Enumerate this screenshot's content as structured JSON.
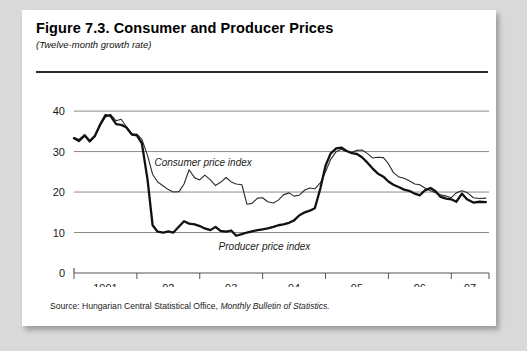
{
  "figure": {
    "title": "Figure 7.3.  Consumer and Producer Prices",
    "subtitle": "(Twelve-month growth rate)",
    "source_prefix": "Source:  Hungarian Central Statistical Office,",
    "source_italic": "Monthly Bulletin of Statistics."
  },
  "chart_data": {
    "type": "line",
    "title": "Figure 7.3.  Consumer and Producer Prices",
    "subtitle": "(Twelve-month growth rate)",
    "xlabel": "",
    "ylabel": "",
    "ylim": [
      0,
      42
    ],
    "yticks": [
      0,
      10,
      20,
      30,
      40
    ],
    "ytick_labels": [
      "0",
      "10",
      "20",
      "30",
      "40"
    ],
    "xlim": [
      1991.0,
      1997.6
    ],
    "xtick_labels": [
      "1991",
      "92",
      "93",
      "94",
      "95",
      "96",
      "97"
    ],
    "xtick_label_positions": [
      1991.5,
      1992.5,
      1993.5,
      1994.5,
      1995.5,
      1996.5,
      1997.3
    ],
    "xtick_marks": [
      1991.0,
      1992.0,
      1993.0,
      1994.0,
      1995.0,
      1996.0,
      1997.0,
      1997.6
    ],
    "grid": "horizontal",
    "legend": "inline-annotations",
    "annotations": [
      {
        "text": "Consumer price index",
        "x": 1992.28,
        "y": 26.4
      },
      {
        "text": "Producer price index",
        "x": 1993.3,
        "y": 5.6
      }
    ],
    "series": [
      {
        "name": "Consumer price index",
        "color": "#2b2b2b",
        "line_width": 1.1,
        "x": [
          1991.0,
          1991.08,
          1991.17,
          1991.25,
          1991.33,
          1991.42,
          1991.5,
          1991.58,
          1991.67,
          1991.75,
          1991.83,
          1991.92,
          1992.0,
          1992.08,
          1992.17,
          1992.25,
          1992.33,
          1992.42,
          1992.5,
          1992.58,
          1992.67,
          1992.75,
          1992.83,
          1992.92,
          1993.0,
          1993.08,
          1993.17,
          1993.25,
          1993.33,
          1993.42,
          1993.5,
          1993.58,
          1993.67,
          1993.75,
          1993.83,
          1993.92,
          1994.0,
          1994.08,
          1994.17,
          1994.25,
          1994.33,
          1994.42,
          1994.5,
          1994.58,
          1994.67,
          1994.75,
          1994.83,
          1994.92,
          1995.0,
          1995.08,
          1995.17,
          1995.25,
          1995.33,
          1995.42,
          1995.5,
          1995.58,
          1995.67,
          1995.75,
          1995.83,
          1995.92,
          1996.0,
          1996.08,
          1996.17,
          1996.25,
          1996.33,
          1996.42,
          1996.5,
          1996.58,
          1996.67,
          1996.75,
          1996.83,
          1996.92,
          1997.0,
          1997.08,
          1997.17,
          1997.25,
          1997.35,
          1997.45,
          1997.55
        ],
        "y": [
          33.5,
          33.0,
          34.2,
          32.8,
          34.0,
          36.5,
          38.5,
          39.2,
          37.6,
          38.0,
          36.2,
          34.4,
          34.3,
          33.0,
          29.0,
          24.4,
          22.5,
          21.5,
          20.6,
          20.0,
          20.1,
          22.0,
          25.5,
          23.5,
          23.0,
          24.2,
          23.0,
          21.6,
          22.4,
          23.6,
          22.5,
          22.0,
          21.8,
          17.0,
          17.2,
          18.5,
          18.6,
          17.6,
          17.3,
          18.0,
          19.3,
          19.8,
          19.0,
          19.2,
          20.5,
          21.0,
          20.8,
          22.3,
          25.0,
          28.0,
          30.0,
          30.6,
          30.0,
          29.8,
          30.3,
          30.4,
          29.5,
          28.4,
          28.6,
          28.5,
          27.0,
          24.8,
          23.7,
          23.4,
          22.8,
          22.0,
          21.8,
          21.0,
          20.3,
          19.8,
          19.3,
          19.0,
          18.6,
          19.8,
          20.3,
          19.9,
          18.6,
          18.4,
          18.5
        ]
      },
      {
        "name": "Producer price index",
        "color": "#111111",
        "line_width": 2.3,
        "x": [
          1991.0,
          1991.08,
          1991.17,
          1991.25,
          1991.33,
          1991.42,
          1991.5,
          1991.58,
          1991.67,
          1991.75,
          1991.83,
          1991.92,
          1992.0,
          1992.08,
          1992.17,
          1992.25,
          1992.33,
          1992.42,
          1992.5,
          1992.58,
          1992.67,
          1992.75,
          1992.83,
          1992.92,
          1993.0,
          1993.08,
          1993.17,
          1993.25,
          1993.33,
          1993.42,
          1993.5,
          1993.58,
          1993.67,
          1993.75,
          1993.83,
          1993.92,
          1994.0,
          1994.08,
          1994.17,
          1994.25,
          1994.33,
          1994.42,
          1994.5,
          1994.58,
          1994.67,
          1994.75,
          1994.83,
          1994.92,
          1995.0,
          1995.08,
          1995.17,
          1995.25,
          1995.33,
          1995.42,
          1995.5,
          1995.58,
          1995.67,
          1995.75,
          1995.83,
          1995.92,
          1996.0,
          1996.08,
          1996.17,
          1996.25,
          1996.33,
          1996.42,
          1996.5,
          1996.58,
          1996.67,
          1996.75,
          1996.83,
          1996.92,
          1997.0,
          1997.08,
          1997.17,
          1997.25,
          1997.35,
          1997.45,
          1997.55
        ],
        "y": [
          33.3,
          32.6,
          34.0,
          32.5,
          33.8,
          36.8,
          39.0,
          38.8,
          36.8,
          36.6,
          36.0,
          34.2,
          34.0,
          32.0,
          23.0,
          11.8,
          10.2,
          10.0,
          10.3,
          10.0,
          11.5,
          12.8,
          12.2,
          12.0,
          11.6,
          11.0,
          10.6,
          11.4,
          10.4,
          10.2,
          10.5,
          9.2,
          9.6,
          10.0,
          10.3,
          10.6,
          10.8,
          11.0,
          11.4,
          11.8,
          12.0,
          12.4,
          13.0,
          14.2,
          15.0,
          15.4,
          16.0,
          21.0,
          26.5,
          29.5,
          30.8,
          31.0,
          30.2,
          29.6,
          29.4,
          28.6,
          27.2,
          25.8,
          24.6,
          23.8,
          22.6,
          21.8,
          21.2,
          20.6,
          20.3,
          19.6,
          19.2,
          20.4,
          21.0,
          20.2,
          18.8,
          18.4,
          18.2,
          17.6,
          19.6,
          18.2,
          17.4,
          17.6,
          17.5
        ]
      }
    ]
  }
}
